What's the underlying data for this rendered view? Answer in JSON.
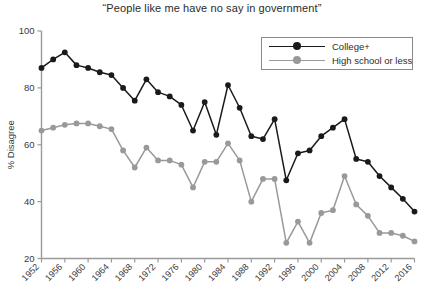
{
  "chart_data": {
    "type": "line",
    "title": "“People like me have no say in government”",
    "xlabel": "",
    "ylabel": "% Disagree",
    "ylim": [
      20,
      100
    ],
    "ytick_values": [
      20,
      40,
      60,
      80,
      100
    ],
    "ytick_labels": [
      "20",
      "40",
      "60",
      "80",
      "100"
    ],
    "xlim": [
      1952,
      2016
    ],
    "xtick_labels": [
      "1952",
      "1956",
      "1960",
      "1964",
      "1968",
      "1972",
      "1976",
      "1980",
      "1984",
      "1988",
      "1992",
      "1996",
      "2000",
      "2004",
      "2008",
      "2012",
      "2016"
    ],
    "x": [
      1952,
      1954,
      1956,
      1958,
      1960,
      1962,
      1964,
      1966,
      1968,
      1970,
      1972,
      1974,
      1976,
      1978,
      1980,
      1982,
      1984,
      1986,
      1988,
      1990,
      1992,
      1994,
      1996,
      1998,
      2000,
      2002,
      2004,
      2006,
      2008,
      2010,
      2012,
      2014,
      2016
    ],
    "grid": false,
    "legend_position": "top-right",
    "series": [
      {
        "name": "College+",
        "color": "#1a1a1a",
        "marker": "circle",
        "values": [
          87,
          90,
          92.5,
          88,
          87,
          85.5,
          84.5,
          80,
          75.5,
          83,
          78.5,
          77,
          74,
          65,
          75,
          63.5,
          81,
          73,
          63,
          62,
          69,
          47.5,
          57,
          58,
          63,
          66,
          69,
          55,
          54,
          49,
          45,
          41,
          36.5
        ]
      },
      {
        "name": "High school or less",
        "color": "#999999",
        "marker": "circle",
        "values": [
          65,
          66,
          67,
          67.5,
          67.5,
          66.5,
          65.5,
          58,
          52,
          59,
          54.5,
          54.5,
          53,
          45,
          54,
          54,
          60.5,
          54.5,
          40,
          48,
          48,
          25.5,
          33,
          25.5,
          36,
          37,
          49,
          39,
          35,
          29,
          29,
          28,
          26
        ]
      }
    ]
  }
}
